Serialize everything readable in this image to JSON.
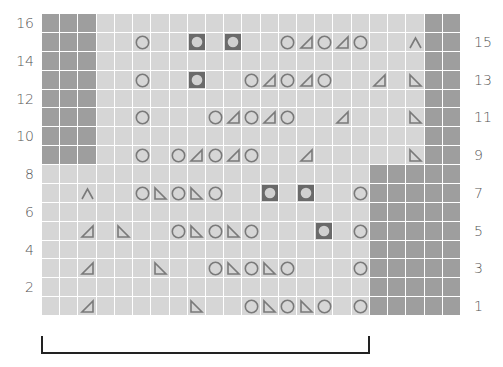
{
  "chart_title": "Lace knitting chart",
  "grid": {
    "columns": 23,
    "rows": 16
  },
  "colors": {
    "light_cell": "#d6d6d6",
    "no_stitch_cell": "#9e9e9e",
    "grid_line": "#ffffff",
    "symbol": "#7a7a7a",
    "bobble_fill": "#6a6a6a",
    "bracket": "#222222"
  },
  "legend_symbols": {
    "O": "yarn-over (circle)",
    "L": "left-leaning decrease (triangle ◿)",
    "R": "right-leaning decrease (triangle ◺)",
    "A": "double decrease (caret ∧)",
    "B": "bobble (filled square with circle)"
  },
  "left_labels": [
    "16",
    "14",
    "12",
    "10",
    "8",
    "6",
    "4",
    "2"
  ],
  "right_labels": [
    "15",
    "13",
    "11",
    "9",
    "7",
    "5",
    "3",
    "1"
  ],
  "no_stitch_regions": [
    {
      "rows": [
        9,
        16
      ],
      "cols": [
        0,
        2
      ]
    },
    {
      "rows": [
        9,
        16
      ],
      "cols": [
        21,
        22
      ]
    },
    {
      "rows": [
        1,
        8
      ],
      "cols": [
        18,
        22
      ]
    }
  ],
  "rows": {
    "15": [
      [
        5,
        "O"
      ],
      [
        8,
        "B"
      ],
      [
        10,
        "B"
      ],
      [
        13,
        "O"
      ],
      [
        14,
        "L"
      ],
      [
        15,
        "O"
      ],
      [
        16,
        "L"
      ],
      [
        17,
        "O"
      ],
      [
        20,
        "A"
      ]
    ],
    "13": [
      [
        5,
        "O"
      ],
      [
        8,
        "B"
      ],
      [
        11,
        "O"
      ],
      [
        12,
        "L"
      ],
      [
        13,
        "O"
      ],
      [
        14,
        "L"
      ],
      [
        15,
        "O"
      ],
      [
        18,
        "L"
      ],
      [
        20,
        "R"
      ]
    ],
    "11": [
      [
        5,
        "O"
      ],
      [
        9,
        "O"
      ],
      [
        10,
        "L"
      ],
      [
        11,
        "O"
      ],
      [
        12,
        "L"
      ],
      [
        13,
        "O"
      ],
      [
        16,
        "L"
      ],
      [
        20,
        "R"
      ]
    ],
    "9": [
      [
        5,
        "O"
      ],
      [
        7,
        "O"
      ],
      [
        8,
        "L"
      ],
      [
        9,
        "O"
      ],
      [
        10,
        "L"
      ],
      [
        11,
        "O"
      ],
      [
        14,
        "L"
      ],
      [
        20,
        "R"
      ]
    ],
    "7": [
      [
        2,
        "A"
      ],
      [
        5,
        "O"
      ],
      [
        6,
        "R"
      ],
      [
        7,
        "O"
      ],
      [
        8,
        "R"
      ],
      [
        9,
        "O"
      ],
      [
        12,
        "B"
      ],
      [
        14,
        "B"
      ],
      [
        17,
        "O"
      ]
    ],
    "5": [
      [
        2,
        "L"
      ],
      [
        4,
        "R"
      ],
      [
        7,
        "O"
      ],
      [
        8,
        "R"
      ],
      [
        9,
        "O"
      ],
      [
        10,
        "R"
      ],
      [
        11,
        "O"
      ],
      [
        15,
        "B"
      ],
      [
        17,
        "O"
      ]
    ],
    "3": [
      [
        2,
        "L"
      ],
      [
        6,
        "R"
      ],
      [
        9,
        "O"
      ],
      [
        10,
        "R"
      ],
      [
        11,
        "O"
      ],
      [
        12,
        "R"
      ],
      [
        13,
        "O"
      ],
      [
        17,
        "O"
      ]
    ],
    "1": [
      [
        2,
        "L"
      ],
      [
        8,
        "R"
      ],
      [
        11,
        "O"
      ],
      [
        12,
        "R"
      ],
      [
        13,
        "O"
      ],
      [
        14,
        "R"
      ],
      [
        15,
        "O"
      ],
      [
        17,
        "O"
      ]
    ]
  },
  "bracket": {
    "from_col": 0,
    "to_col": 17,
    "meaning": "pattern repeat"
  }
}
